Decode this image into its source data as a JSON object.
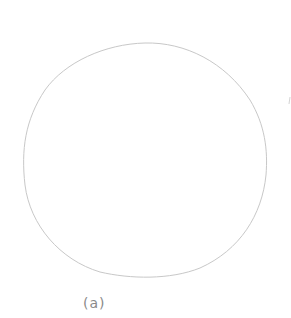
{
  "figure": {
    "label": "(a)",
    "shape": "circle",
    "stroke_color": "#c8c8c8",
    "background": "#ffffff"
  }
}
